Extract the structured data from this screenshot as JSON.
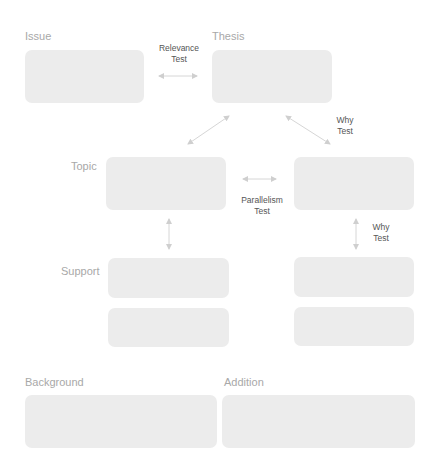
{
  "diagram": {
    "labels": {
      "issue": "Issue",
      "thesis": "Thesis",
      "topic": "Topic",
      "support": "Support",
      "background": "Background",
      "addition": "Addition"
    },
    "tests": {
      "relevance_line1": "Relevance",
      "relevance_line2": "Test",
      "why_top_line1": "Why",
      "why_top_line2": "Test",
      "parallelism_line1": "Parallelism",
      "parallelism_line2": "Test",
      "why_right_line1": "Why",
      "why_right_line2": "Test"
    },
    "colors": {
      "box_fill": "#ececec",
      "label_text": "#a8a8a8",
      "test_text": "#555555",
      "arrow": "#d0d0d0"
    }
  }
}
